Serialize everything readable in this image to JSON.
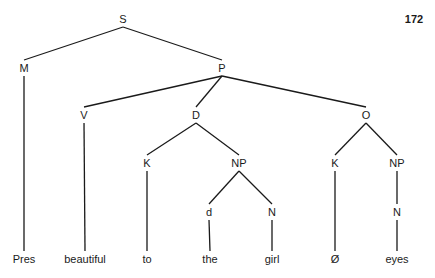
{
  "page_number": "172",
  "tree": {
    "nodes": [
      {
        "id": "S",
        "label": "S",
        "x": 123,
        "y": 19
      },
      {
        "id": "M",
        "label": "M",
        "x": 24,
        "y": 68
      },
      {
        "id": "P",
        "label": "P",
        "x": 222,
        "y": 68
      },
      {
        "id": "V",
        "label": "V",
        "x": 84,
        "y": 115
      },
      {
        "id": "D",
        "label": "D",
        "x": 196,
        "y": 115
      },
      {
        "id": "O",
        "label": "O",
        "x": 366,
        "y": 115
      },
      {
        "id": "K1",
        "label": "K",
        "x": 147,
        "y": 163
      },
      {
        "id": "NP1",
        "label": "NP",
        "x": 239,
        "y": 163
      },
      {
        "id": "K2",
        "label": "K",
        "x": 335,
        "y": 163
      },
      {
        "id": "NP2",
        "label": "NP",
        "x": 397,
        "y": 163
      },
      {
        "id": "d",
        "label": "d",
        "x": 209,
        "y": 212
      },
      {
        "id": "N1",
        "label": "N",
        "x": 272,
        "y": 212
      },
      {
        "id": "N2",
        "label": "N",
        "x": 397,
        "y": 212
      },
      {
        "id": "w1",
        "label": "Pres",
        "x": 24,
        "y": 259
      },
      {
        "id": "w2",
        "label": "beautiful",
        "x": 85,
        "y": 259
      },
      {
        "id": "w3",
        "label": "to",
        "x": 147,
        "y": 259
      },
      {
        "id": "w4",
        "label": "the",
        "x": 210,
        "y": 259
      },
      {
        "id": "w5",
        "label": "girl",
        "x": 272,
        "y": 259
      },
      {
        "id": "w6",
        "label": "Ø",
        "x": 335,
        "y": 259
      },
      {
        "id": "w7",
        "label": "eyes",
        "x": 397,
        "y": 259
      }
    ],
    "edges": [
      [
        "S",
        "M"
      ],
      [
        "S",
        "P"
      ],
      [
        "M",
        "w1"
      ],
      [
        "P",
        "V"
      ],
      [
        "P",
        "D"
      ],
      [
        "P",
        "O"
      ],
      [
        "V",
        "w2"
      ],
      [
        "D",
        "K1"
      ],
      [
        "D",
        "NP1"
      ],
      [
        "K1",
        "w3"
      ],
      [
        "NP1",
        "d"
      ],
      [
        "NP1",
        "N1"
      ],
      [
        "d",
        "w4"
      ],
      [
        "N1",
        "w5"
      ],
      [
        "O",
        "K2"
      ],
      [
        "O",
        "NP2"
      ],
      [
        "K2",
        "w6"
      ],
      [
        "NP2",
        "N2"
      ],
      [
        "N2",
        "w7"
      ]
    ]
  }
}
